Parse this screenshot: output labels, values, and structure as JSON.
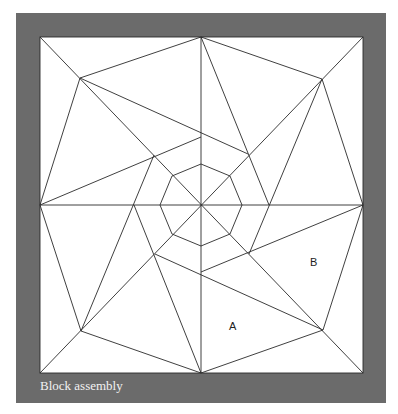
{
  "caption": "Block assembly",
  "labels": [
    {
      "id": "A",
      "text": "A",
      "x": 229,
      "y": 320
    },
    {
      "id": "B",
      "text": "B",
      "x": 310,
      "y": 256
    }
  ],
  "colors": {
    "frame": "#6b6b6b",
    "panel": "#ffffff",
    "line": "#2a2a2a",
    "caption": "#f2f2f2"
  },
  "geometry": {
    "square": {
      "x1": 40,
      "y1": 37,
      "x2": 363,
      "y2": 373
    },
    "center": [
      201,
      205
    ],
    "lines": [
      [
        40,
        205,
        363,
        205
      ],
      [
        201,
        37,
        201,
        373
      ],
      [
        40,
        37,
        363,
        373
      ],
      [
        363,
        37,
        40,
        373
      ],
      [
        80,
        78,
        201,
        37
      ],
      [
        322,
        79,
        363,
        205
      ],
      [
        323,
        330,
        201,
        373
      ],
      [
        81,
        331,
        40,
        205
      ],
      [
        80,
        78,
        40,
        205
      ],
      [
        322,
        79,
        201,
        37
      ],
      [
        323,
        330,
        363,
        205
      ],
      [
        81,
        331,
        201,
        373
      ],
      [
        80,
        78,
        248,
        154
      ],
      [
        322,
        79,
        249,
        254
      ],
      [
        323,
        330,
        155,
        254
      ],
      [
        81,
        331,
        154,
        155
      ],
      [
        40,
        205,
        201,
        137
      ],
      [
        201,
        37,
        269,
        205
      ],
      [
        363,
        205,
        201,
        272
      ],
      [
        201,
        373,
        134,
        205
      ]
    ],
    "octagon": [
      [
        201,
        164
      ],
      [
        230,
        176
      ],
      [
        242,
        205
      ],
      [
        230,
        234
      ],
      [
        201,
        246
      ],
      [
        172,
        234
      ],
      [
        160,
        205
      ],
      [
        172,
        176
      ]
    ]
  }
}
